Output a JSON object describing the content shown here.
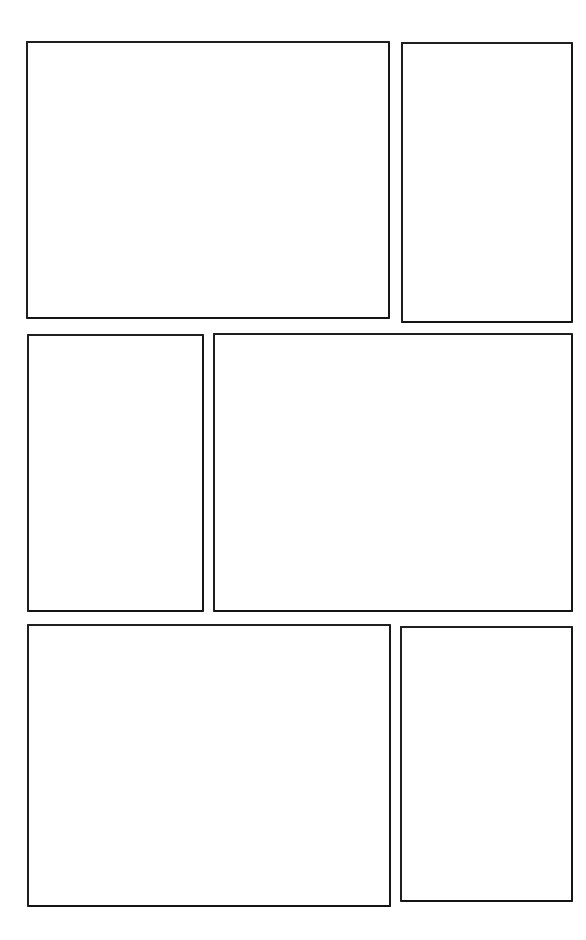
{
  "page": {
    "background_color": "#ffffff",
    "border_color": "#1c1c1c",
    "width": 586,
    "height": 940,
    "panel_count": 6,
    "row_count": 3
  },
  "rows": [
    {
      "name": "row-1",
      "panels": [
        {
          "id": "panel-1",
          "label": "",
          "x": 26,
          "y": 41,
          "width": 364,
          "height": 278,
          "content": ""
        },
        {
          "id": "panel-2",
          "label": "",
          "x": 401,
          "y": 42,
          "width": 172,
          "height": 281,
          "content": ""
        }
      ]
    },
    {
      "name": "row-2",
      "panels": [
        {
          "id": "panel-3",
          "label": "",
          "x": 27,
          "y": 334,
          "width": 177,
          "height": 278,
          "content": ""
        },
        {
          "id": "panel-4",
          "label": "",
          "x": 213,
          "y": 333,
          "width": 360,
          "height": 279,
          "content": ""
        }
      ]
    },
    {
      "name": "row-3",
      "panels": [
        {
          "id": "panel-5",
          "label": "",
          "x": 27,
          "y": 624,
          "width": 364,
          "height": 283,
          "content": ""
        },
        {
          "id": "panel-6",
          "label": "",
          "x": 400,
          "y": 626,
          "width": 173,
          "height": 276,
          "content": ""
        }
      ]
    }
  ]
}
